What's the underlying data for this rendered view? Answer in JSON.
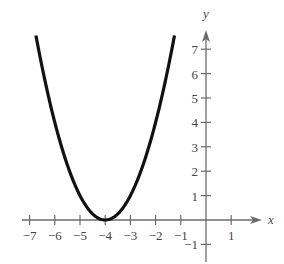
{
  "chart_data": {
    "type": "line",
    "title": "",
    "xlabel": "x",
    "ylabel": "y",
    "function": "y = (x + 4)^2",
    "vertex": [
      -4,
      0
    ],
    "xlim": [
      -7.4,
      1.5
    ],
    "ylim": [
      -1.4,
      8.0
    ],
    "grid": false,
    "legend": null,
    "x_ticks": [
      -7,
      -6,
      -5,
      -4,
      -3,
      -2,
      -1,
      1
    ],
    "x_tick_labels": [
      "−7",
      "−6",
      "−5",
      "−4",
      "−3",
      "−2",
      "−1",
      "1"
    ],
    "y_ticks": [
      -1,
      1,
      2,
      3,
      4,
      5,
      6,
      7
    ],
    "y_tick_labels": [
      "−1",
      "1",
      "2",
      "3",
      "4",
      "5",
      "6",
      "7"
    ],
    "series": [
      {
        "name": "parabola",
        "color": "#111111",
        "x_range": [
          -6.75,
          -1.25
        ],
        "x": [
          -6.75,
          -6.5,
          -6,
          -5.5,
          -5,
          -4.5,
          -4,
          -3.5,
          -3,
          -2.5,
          -2,
          -1.5,
          -1.25
        ],
        "y": [
          7.5625,
          6.25,
          4,
          2.25,
          1,
          0.25,
          0,
          0.25,
          1,
          2.25,
          4,
          6.25,
          7.5625
        ]
      }
    ]
  },
  "layout": {
    "origin_px": [
      206,
      220
    ],
    "x_unit_px": 25.2,
    "y_unit_px": 24.4,
    "x_axis_px": [
      22,
      262
    ],
    "y_axis_px": [
      262,
      30
    ],
    "axis_color": "#6b6b6b",
    "curve_color": "#111111",
    "label_color": "#444444"
  }
}
